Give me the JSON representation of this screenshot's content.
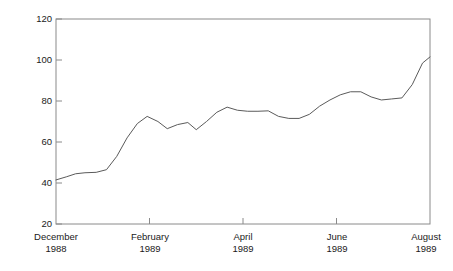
{
  "figure": {
    "title": "",
    "top_caption_remnant": "",
    "background_color": "#ffffff",
    "line_color": "#5a5a5a",
    "axis_color": "#8a8a8a",
    "text_color": "#1a1a1a"
  },
  "axes": {
    "y_title": "Share price (p)",
    "y_tick_labels": [
      "120",
      "100",
      "80",
      "60",
      "40",
      "20"
    ],
    "x_tick_labels": [
      {
        "month": "December",
        "year": "1988"
      },
      {
        "month": "February",
        "year": "1989"
      },
      {
        "month": "April",
        "year": "1989"
      },
      {
        "month": "June",
        "year": "1989"
      },
      {
        "month": "August",
        "year": "1989"
      }
    ]
  },
  "chart_data": {
    "type": "line",
    "title": "",
    "xlabel": "",
    "ylabel": "Share price (p)",
    "ylim": [
      20,
      120
    ],
    "ytick_values": [
      20,
      40,
      60,
      80,
      100,
      120
    ],
    "xlim_labels": [
      "December 1988",
      "August 1989"
    ],
    "xtick_labels": [
      "December 1988",
      "February 1989",
      "April 1989",
      "June 1989",
      "August 1989"
    ],
    "xtick_positions_months": [
      0,
      2,
      4,
      6,
      8
    ],
    "grid": false,
    "legend": null,
    "series": [
      {
        "name": "Share price",
        "x_label": "months from December 1988",
        "x": [
          0.0,
          0.22,
          0.42,
          0.62,
          0.86,
          1.08,
          1.3,
          1.52,
          1.74,
          1.95,
          2.18,
          2.38,
          2.6,
          2.82,
          3.0,
          3.22,
          3.44,
          3.66,
          3.88,
          4.1,
          4.32,
          4.54,
          4.76,
          4.98,
          5.2,
          5.42,
          5.64,
          5.86,
          6.08,
          6.3,
          6.52,
          6.74,
          6.96,
          7.18,
          7.4,
          7.62,
          7.84,
          8.0
        ],
        "values": [
          41.5,
          43.0,
          44.5,
          45.0,
          45.2,
          46.5,
          53.0,
          62.0,
          69.0,
          72.5,
          70.0,
          66.5,
          68.5,
          69.5,
          66.0,
          70.0,
          74.5,
          77.0,
          75.5,
          75.0,
          75.0,
          75.2,
          72.5,
          71.5,
          71.5,
          73.5,
          77.5,
          80.5,
          83.0,
          84.5,
          84.5,
          82.0,
          80.5,
          81.0,
          81.5,
          88.0,
          98.5,
          101.5
        ],
        "units": "pence"
      }
    ]
  }
}
